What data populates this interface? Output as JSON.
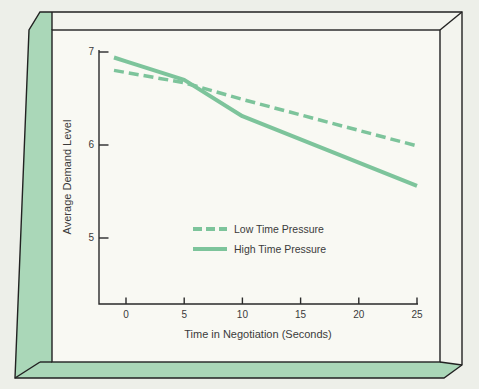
{
  "colors": {
    "page_bg": "#edefe9",
    "panel_bg": "#f9f9f3",
    "face_white": "#f3f4ee",
    "frame_green": "#aad7b8",
    "line_green": "#7dc49b",
    "ink": "#222222",
    "text": "#3b3b3b"
  },
  "chart_data": {
    "type": "line",
    "title": "",
    "xlabel": "Time in Negotiation (Seconds)",
    "ylabel": "Average Demand Level",
    "xticks": [
      0,
      5,
      10,
      15,
      20,
      25
    ],
    "yticks": [
      7,
      6,
      5
    ],
    "xlim": [
      0,
      25
    ],
    "ylim": [
      4.3,
      7
    ],
    "grid": false,
    "legend_position": "center-inside",
    "x": [
      0,
      5,
      10,
      25
    ],
    "series": [
      {
        "name": "Low Time Pressure",
        "style": "dashed",
        "values": [
          6.78,
          6.67,
          6.49,
          5.99
        ]
      },
      {
        "name": "High Time Pressure",
        "style": "solid",
        "values": [
          6.9,
          6.7,
          6.31,
          5.56
        ]
      }
    ]
  }
}
